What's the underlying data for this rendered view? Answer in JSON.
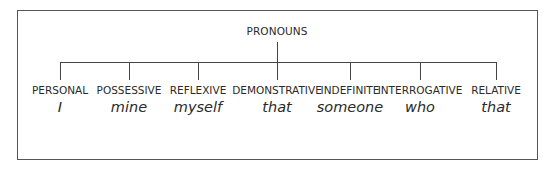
{
  "diagram": {
    "root": "PRONOUNS",
    "children": [
      {
        "category": "PERSONAL",
        "example": "I",
        "x": 60
      },
      {
        "category": "POSSESSIVE",
        "example": "mine",
        "x": 129
      },
      {
        "category": "REFLEXIVE",
        "example": "myself",
        "x": 198
      },
      {
        "category": "DEMONSTRATIVE",
        "example": "that",
        "x": 277
      },
      {
        "category": "INDEFINITE",
        "example": "someone",
        "x": 350
      },
      {
        "category": "INTERROGATIVE",
        "example": "who",
        "x": 420
      },
      {
        "category": "RELATIVE",
        "example": "that",
        "x": 496
      }
    ]
  }
}
